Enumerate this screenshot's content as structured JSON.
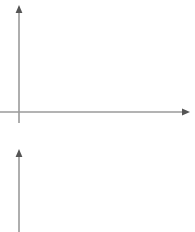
{
  "figure": {
    "background_color": "#ffffff",
    "axis_color": "#9a9a9a",
    "curve_color": "#555555",
    "panel_count": 2
  },
  "chart_data": [
    {
      "type": "line",
      "title": "",
      "subtitle": "",
      "xlabel": "",
      "ylabel": "",
      "legend": [],
      "annotations": [],
      "grid": false,
      "axes": {
        "x_axis_visible": true,
        "y_axis_visible": true,
        "x_axis_arrow": "right",
        "y_axis_arrow": "up",
        "x_ticks": [],
        "y_ticks": [],
        "xlim": [
          0,
          1
        ],
        "ylim": [
          0,
          1
        ]
      },
      "series": [
        {
          "name": "downward-parabola",
          "shape": "concave-down parabola",
          "x": [
            0.0,
            0.05,
            0.1,
            0.15,
            0.2,
            0.25,
            0.3,
            0.35,
            0.4,
            0.45,
            0.5,
            0.55,
            0.6,
            0.65,
            0.7,
            0.75,
            0.8,
            0.85,
            0.9,
            0.95,
            1.0
          ],
          "y": [
            0.0,
            0.19,
            0.36,
            0.51,
            0.64,
            0.75,
            0.84,
            0.91,
            0.96,
            0.99,
            1.0,
            0.99,
            0.96,
            0.91,
            0.84,
            0.75,
            0.64,
            0.51,
            0.36,
            0.19,
            0.0
          ],
          "x_intercepts": [
            0.0,
            1.0
          ],
          "vertex": [
            0.5,
            1.0
          ]
        }
      ]
    },
    {
      "type": "line",
      "title": "",
      "subtitle": "",
      "xlabel": "",
      "ylabel": "",
      "legend": [],
      "annotations": [],
      "grid": false,
      "cropped": true,
      "axes": {
        "x_axis_visible": false,
        "y_axis_visible": true,
        "y_axis_arrow": "up",
        "x_ticks": [],
        "y_ticks": [],
        "xlim": [
          0,
          1
        ],
        "ylim": [
          0,
          1
        ]
      },
      "series": [
        {
          "name": "descending-curve",
          "shape": "concave-down decreasing curve from peak",
          "x": [
            0.02,
            0.07,
            0.12,
            0.17,
            0.22,
            0.27,
            0.32,
            0.37,
            0.42
          ],
          "y": [
            1.0,
            0.97,
            0.91,
            0.82,
            0.7,
            0.56,
            0.4,
            0.22,
            0.03
          ],
          "peak": [
            0.02,
            1.0
          ]
        },
        {
          "name": "rising-curve-segment",
          "shape": "increasing curve segment at lower right",
          "x": [
            0.78,
            0.83,
            0.88,
            0.93,
            0.98
          ],
          "y": [
            0.0,
            0.04,
            0.1,
            0.17,
            0.25
          ]
        }
      ]
    }
  ]
}
